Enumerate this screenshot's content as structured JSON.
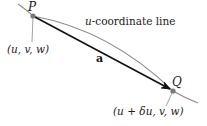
{
  "diagram": {
    "point_p": {
      "label": "P",
      "coords_label": "(u, v, w)"
    },
    "point_q": {
      "label": "Q",
      "coords_label": "(u + δu, v, w)"
    },
    "curve_label": {
      "var": "u",
      "rest": "-coordinate line"
    },
    "vector_label": "a",
    "colors": {
      "curve": "#8a8a8a",
      "vector": "#111111",
      "point": "#7a7a7a",
      "leader": "#8a8a8a"
    }
  }
}
